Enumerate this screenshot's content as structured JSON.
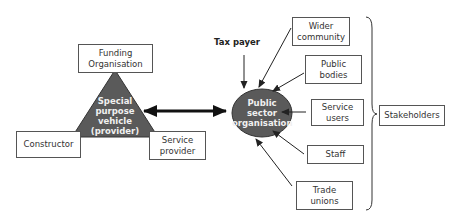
{
  "diagram": {
    "type": "stakeholder-relationship-diagram",
    "nodes": {
      "funding": "Funding Organisation",
      "spv": "Special purpose vehicle (provider)",
      "constructor": "Constructor",
      "service_provider": "Service provider",
      "public_sector": "Public sector organisation",
      "tax_payer": "Tax payer",
      "wider_community": "Wider community",
      "public_bodies": "Public bodies",
      "service_users": "Service users",
      "staff": "Staff",
      "trade_unions": "Trade unions",
      "stakeholders": "Stakeholders"
    },
    "spv_lines": [
      "Special",
      "purpose",
      "vehicle",
      "(provider)"
    ],
    "ps_lines": [
      "Public",
      "sector",
      "organisation"
    ],
    "edges": [
      {
        "from": "spv",
        "to": "public_sector",
        "style": "bidirectional-thick"
      },
      {
        "from": "tax_payer",
        "to": "public_sector"
      },
      {
        "from": "wider_community",
        "to": "public_sector"
      },
      {
        "from": "public_bodies",
        "to": "public_sector"
      },
      {
        "from": "service_users",
        "to": "public_sector"
      },
      {
        "from": "staff",
        "to": "public_sector"
      },
      {
        "from": "trade_unions",
        "to": "public_sector"
      }
    ],
    "group": {
      "label": "Stakeholders",
      "members": [
        "wider_community",
        "public_bodies",
        "service_users",
        "staff",
        "trade_unions"
      ]
    },
    "colors": {
      "shape_fill": "#5a5a5a",
      "shape_stroke": "#333333",
      "shape_text": "#f0f0f0"
    }
  }
}
